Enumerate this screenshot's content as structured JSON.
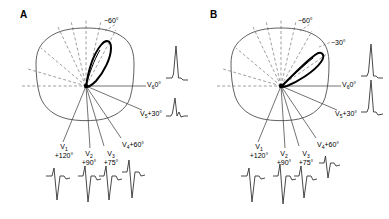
{
  "figure": {
    "background_color": "#ffffff",
    "line_color": "#333333",
    "loop_color": "#000000",
    "dashed_color": "#777777",
    "type": "vectorcardiogram-precordial-lead-diagram"
  },
  "panels": [
    {
      "id": "A",
      "letter": "A",
      "torso": {
        "name": "chest-cross-section-outline"
      },
      "loop": {
        "name": "qrs-vector-loop",
        "orientation_deg": -68,
        "description": "narrow QRS loop directed superiorly and leftward"
      },
      "origin": {
        "x": 86,
        "y": 86
      },
      "dashed_angle_labels": [
        {
          "text": "−60°",
          "value": "-60",
          "x": 104,
          "y": 19
        }
      ],
      "leads": [
        {
          "name": "V1",
          "label_main": "V",
          "sub": "1",
          "angle_text": "+120°",
          "angle_deg": 120,
          "label_x": 57,
          "label_y": 148,
          "stacked": true
        },
        {
          "name": "V2",
          "label_main": "V",
          "sub": "2",
          "angle_text": "+90°",
          "angle_deg": 90,
          "label_x": 88,
          "label_y": 155,
          "stacked": true
        },
        {
          "name": "V3",
          "label_main": "V",
          "sub": "3",
          "angle_text": "+75°",
          "angle_deg": 75,
          "label_x": 108,
          "label_y": 155,
          "stacked": true
        },
        {
          "name": "V4",
          "label_main": "V",
          "sub": "4",
          "angle_text": "+60°",
          "angle_deg": 60,
          "label_x": 124,
          "label_y": 145,
          "stacked": false
        },
        {
          "name": "V5",
          "label_main": "V",
          "sub": "5",
          "angle_text": "+30°",
          "angle_deg": 30,
          "label_x": 143,
          "label_y": 113,
          "stacked": false
        },
        {
          "name": "V6",
          "label_main": "V",
          "sub": "6",
          "angle_text": "0°",
          "angle_deg": 0,
          "label_x": 148,
          "label_y": 82,
          "stacked": false
        }
      ],
      "waveforms": [
        {
          "lead": "V1",
          "pattern": "rS",
          "position": "bottom",
          "x": 57,
          "y": 180
        },
        {
          "lead": "V2",
          "pattern": "rS",
          "position": "bottom",
          "x": 88,
          "y": 180
        },
        {
          "lead": "V3",
          "pattern": "rS",
          "position": "bottom",
          "x": 108,
          "y": 180
        },
        {
          "lead": "V4",
          "pattern": "rS",
          "position": "bottom",
          "x": 130,
          "y": 178
        },
        {
          "lead": "V5",
          "pattern": "small-r-notched",
          "position": "right",
          "x": 176,
          "y": 113
        },
        {
          "lead": "V6",
          "pattern": "tall-R",
          "position": "right",
          "x": 176,
          "y": 68
        }
      ]
    },
    {
      "id": "B",
      "letter": "B",
      "torso": {
        "name": "chest-cross-section-outline"
      },
      "loop": {
        "name": "qrs-vector-loop",
        "orientation_deg": -35,
        "description": "QRS loop directed leftward and slightly superiorly"
      },
      "origin": {
        "x": 86,
        "y": 86
      },
      "dashed_angle_labels": [
        {
          "text": "−60°",
          "value": "-60",
          "x": 103,
          "y": 19
        },
        {
          "text": "−30°",
          "value": "-30",
          "x": 135,
          "y": 43
        }
      ],
      "leads": [
        {
          "name": "V1",
          "label_main": "V",
          "sub": "1",
          "angle_text": "+120°",
          "angle_deg": 120,
          "label_x": 57,
          "label_y": 148,
          "stacked": true
        },
        {
          "name": "V2",
          "label_main": "V",
          "sub": "2",
          "angle_text": "+90°",
          "angle_deg": 90,
          "label_x": 88,
          "label_y": 155,
          "stacked": true
        },
        {
          "name": "V3",
          "label_main": "V",
          "sub": "3",
          "angle_text": "+75°",
          "angle_deg": 75,
          "label_x": 108,
          "label_y": 155,
          "stacked": true
        },
        {
          "name": "V4",
          "label_main": "V",
          "sub": "4",
          "angle_text": "+60°",
          "angle_deg": 60,
          "label_x": 124,
          "label_y": 145,
          "stacked": false
        },
        {
          "name": "V5",
          "label_main": "V",
          "sub": "5",
          "angle_text": "+30°",
          "angle_deg": 30,
          "label_x": 143,
          "label_y": 113,
          "stacked": false
        },
        {
          "name": "V6",
          "label_main": "V",
          "sub": "6",
          "angle_text": "0°",
          "angle_deg": 0,
          "label_x": 148,
          "label_y": 82,
          "stacked": false
        }
      ],
      "waveforms": [
        {
          "lead": "V1",
          "pattern": "rS",
          "position": "bottom",
          "x": 57,
          "y": 180
        },
        {
          "lead": "V2",
          "pattern": "rS",
          "position": "bottom",
          "x": 88,
          "y": 180
        },
        {
          "lead": "V3",
          "pattern": "rS",
          "position": "bottom",
          "x": 108,
          "y": 180
        },
        {
          "lead": "V4",
          "pattern": "small-rs",
          "position": "bottom",
          "x": 130,
          "y": 168
        },
        {
          "lead": "V5",
          "pattern": "tall-R",
          "position": "right",
          "x": 176,
          "y": 108
        },
        {
          "lead": "V6",
          "pattern": "tall-R",
          "position": "right",
          "x": 176,
          "y": 66
        }
      ]
    }
  ]
}
